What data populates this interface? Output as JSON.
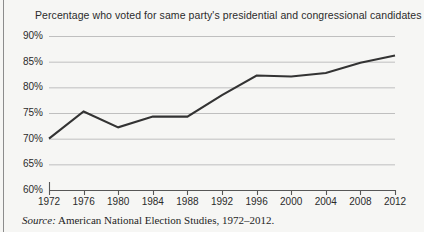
{
  "figure": {
    "title": "Percentage who voted for same party's presidential and congressional candidates",
    "source_label": "Source:",
    "source_text": "American National Election Studies, 1972–2012."
  },
  "axis": {
    "y_ticks": [
      "90%",
      "85%",
      "80%",
      "75%",
      "70%",
      "65%",
      "60%"
    ],
    "x_ticks": [
      "1972",
      "1976",
      "1980",
      "1984",
      "1988",
      "1992",
      "1996",
      "2000",
      "2004",
      "2008",
      "2012"
    ]
  },
  "style": {
    "line_color": "#333333",
    "grid_color": "#b9b9b9",
    "axis_color": "#575757",
    "background": "#f6f6f4",
    "text_color": "#2b2b2b"
  },
  "chart_data": {
    "type": "line",
    "title": "Percentage who voted for same party's presidential and congressional candidates",
    "xlabel": "",
    "ylabel": "",
    "x": [
      1972,
      1976,
      1980,
      1984,
      1988,
      1992,
      1996,
      2000,
      2004,
      2008,
      2012
    ],
    "categories": [
      "1972",
      "1976",
      "1980",
      "1984",
      "1988",
      "1992",
      "1996",
      "2000",
      "2004",
      "2008",
      "2012"
    ],
    "values": [
      70.0,
      75.3,
      72.2,
      74.3,
      74.3,
      78.5,
      82.3,
      82.1,
      82.8,
      84.8,
      86.2
    ],
    "ylim": [
      60,
      90
    ],
    "ytick_values": [
      90,
      85,
      80,
      75,
      70,
      65,
      60
    ],
    "ytick_labels": [
      "90%",
      "85%",
      "80%",
      "75%",
      "70%",
      "65%",
      "60%"
    ],
    "xlim": [
      1972,
      2012
    ],
    "grid": "horizontal",
    "legend": "none",
    "units": "percent",
    "series": [
      {
        "name": "Same-party presidential and congressional vote",
        "values": [
          70.0,
          75.3,
          72.2,
          74.3,
          74.3,
          78.5,
          82.3,
          82.1,
          82.8,
          84.8,
          86.2
        ]
      }
    ]
  }
}
